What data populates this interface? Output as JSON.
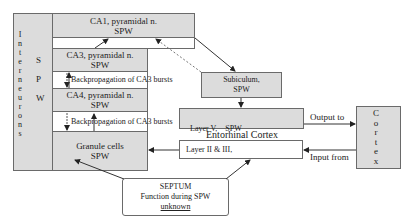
{
  "interneurons": {
    "letters": [
      "I",
      "n",
      "t",
      "e",
      "r",
      "n",
      "e",
      "u",
      "r",
      "o",
      "n",
      "s"
    ],
    "spw_letters": [
      "S",
      "P",
      "W"
    ]
  },
  "ca1": {
    "line1": "CA1, pyramidal n.",
    "line2": "SPW"
  },
  "ca3": {
    "line1": "CA3, pyramidal n.",
    "line2": "SPW"
  },
  "ca4": {
    "line1": "CA4, pyramidal n.",
    "line2": "SPW"
  },
  "granule": {
    "line1": "Granule cells",
    "line2": "SPW"
  },
  "backprop1": "Backpropagation of CA3 bursts",
  "backprop2": "Backpropagation of CA3 bursts",
  "subiculum": {
    "line1": "Subiculum,",
    "line2": "SPW"
  },
  "layer5": "Layer V,    SPW",
  "entorhinal": "Entorhinal Cortex",
  "layer23": "Layer II & III,",
  "output_to": "Output to",
  "input_from": "Input from",
  "cortex": {
    "letters": [
      "C",
      "o",
      "r",
      "t",
      "e",
      "x"
    ]
  },
  "septum": {
    "line1": "SEPTUM",
    "line2": "Function during SPW",
    "line3": "unknown"
  }
}
